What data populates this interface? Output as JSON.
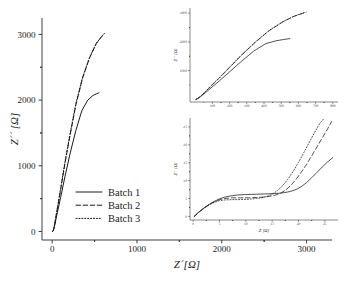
{
  "figure": {
    "background_color": "#ffffff",
    "line_color": "#1a1a1a"
  },
  "legend": {
    "entries": [
      {
        "label": "Batch 1",
        "style": "solid"
      },
      {
        "label": "Batch 2",
        "style": "dashed"
      },
      {
        "label": "Batch 3",
        "style": "dotted"
      }
    ]
  },
  "chart_data": [
    {
      "id": "main",
      "type": "line",
      "title": "",
      "xlabel": "Z´[Ω]",
      "ylabel": "Z´´ [Ω]",
      "xlim": [
        -120,
        3300
      ],
      "ylim": [
        -130,
        3250
      ],
      "xticks": [
        0,
        1000,
        2000,
        3000
      ],
      "yticks": [
        0,
        1000,
        2000,
        3000
      ],
      "xtick_labels": [
        "0",
        "1000",
        "2000",
        "3000"
      ],
      "ytick_labels": [
        "0",
        "1000",
        "2000",
        "3000"
      ],
      "minor_ticks": true,
      "grid": false,
      "legend_position": "center-left",
      "series": [
        {
          "name": "Batch 1",
          "style": "solid",
          "x": [
            5,
            12,
            20,
            30,
            45,
            70,
            100,
            150,
            210,
            280,
            350,
            420,
            480,
            520,
            550
          ],
          "y": [
            0,
            12,
            40,
            95,
            190,
            340,
            520,
            830,
            1180,
            1540,
            1840,
            2000,
            2070,
            2095,
            2110
          ]
        },
        {
          "name": "Batch 2",
          "style": "dashed",
          "x": [
            5,
            12,
            20,
            30,
            45,
            70,
            100,
            150,
            210,
            280,
            360,
            440,
            520,
            580,
            615
          ],
          "y": [
            0,
            14,
            48,
            115,
            230,
            410,
            640,
            1030,
            1460,
            1930,
            2340,
            2640,
            2860,
            2960,
            3010
          ]
        },
        {
          "name": "Batch 3",
          "style": "dotted",
          "x": [
            5,
            12,
            20,
            30,
            45,
            70,
            100,
            150,
            210,
            280,
            360,
            440,
            520,
            580,
            612
          ],
          "y": [
            0,
            14,
            50,
            120,
            238,
            420,
            655,
            1050,
            1480,
            1950,
            2355,
            2650,
            2865,
            2965,
            3012
          ]
        }
      ]
    },
    {
      "id": "inset_top",
      "type": "line",
      "title": "",
      "xlabel": "Z´[Ω]",
      "ylabel": "Z´´ [Ω]",
      "xlim": [
        -30,
        830
      ],
      "ylim": [
        -90,
        3180
      ],
      "xticks": [
        100,
        200,
        300,
        400,
        500,
        600,
        700,
        800
      ],
      "yticks": [
        1000,
        2000,
        3000
      ],
      "xtick_labels": [
        "100",
        "200",
        "300",
        "400",
        "500",
        "600",
        "700",
        "800"
      ],
      "ytick_labels": [
        "1000",
        "2000",
        "3000"
      ],
      "minor_ticks": true,
      "grid": false,
      "series": [
        {
          "name": "Batch 1",
          "style": "solid",
          "x": [
            5,
            15,
            30,
            55,
            90,
            140,
            200,
            270,
            340,
            410,
            470,
            515,
            550
          ],
          "y": [
            0,
            30,
            90,
            210,
            390,
            640,
            960,
            1330,
            1680,
            1940,
            2040,
            2085,
            2115
          ]
        },
        {
          "name": "Batch 2",
          "style": "dashed",
          "x": [
            5,
            15,
            30,
            55,
            90,
            140,
            200,
            270,
            350,
            430,
            510,
            570,
            620,
            645
          ],
          "y": [
            0,
            34,
            100,
            240,
            450,
            740,
            1110,
            1540,
            1990,
            2390,
            2700,
            2880,
            2985,
            3035
          ]
        },
        {
          "name": "Batch 3",
          "style": "dotted",
          "x": [
            5,
            15,
            30,
            55,
            90,
            140,
            200,
            270,
            350,
            430,
            510,
            570,
            618,
            642
          ],
          "y": [
            0,
            36,
            104,
            248,
            462,
            755,
            1125,
            1555,
            2000,
            2400,
            2705,
            2885,
            2988,
            3038
          ]
        }
      ]
    },
    {
      "id": "inset_bottom",
      "type": "line",
      "title": "",
      "xlabel": "Z´[Ω]",
      "ylabel": "Z´´ [Ω]",
      "xlim": [
        -0.6,
        27.5
      ],
      "ylim": [
        -1.0,
        27.5
      ],
      "xticks": [
        0,
        5,
        10,
        15,
        20,
        25
      ],
      "yticks": [
        0,
        5,
        10,
        15,
        20,
        25
      ],
      "xtick_labels": [
        "0",
        "5",
        "10",
        "15",
        "20",
        "25"
      ],
      "ytick_labels": [
        "0",
        "5",
        "10",
        "15",
        "20",
        "25"
      ],
      "minor_ticks": true,
      "grid": false,
      "series": [
        {
          "name": "Batch 1",
          "style": "solid",
          "x": [
            0.2,
            1.0,
            2.0,
            3.0,
            4.0,
            5.0,
            6.0,
            7.0,
            8.5,
            10.0,
            12.0,
            14.0,
            15.5,
            16.5,
            17.5,
            18.5,
            19.5,
            20.5,
            21.5,
            22.5,
            23.5,
            24.5,
            25.5,
            26.5
          ],
          "y": [
            0.0,
            1.1,
            2.3,
            3.3,
            4.2,
            4.9,
            5.4,
            5.7,
            6.0,
            6.1,
            6.2,
            6.3,
            6.4,
            6.5,
            6.7,
            7.0,
            7.5,
            8.3,
            9.4,
            10.8,
            12.3,
            13.8,
            15.2,
            16.4
          ]
        },
        {
          "name": "Batch 2",
          "style": "dashed",
          "x": [
            0.2,
            1.0,
            2.0,
            3.0,
            4.0,
            5.0,
            6.0,
            7.5,
            9.0,
            10.5,
            12.0,
            13.5,
            14.5,
            15.5,
            16.5,
            17.5,
            18.5,
            19.5,
            20.5,
            21.5,
            22.5,
            23.5,
            24.5,
            25.5,
            26.3
          ],
          "y": [
            0.0,
            1.1,
            2.3,
            3.3,
            4.1,
            4.7,
            5.0,
            5.2,
            5.2,
            5.2,
            5.3,
            5.4,
            5.6,
            5.9,
            6.4,
            7.3,
            8.6,
            10.3,
            12.3,
            14.5,
            16.9,
            19.4,
            21.9,
            24.4,
            26.5
          ]
        },
        {
          "name": "Batch 3",
          "style": "dotted",
          "x": [
            0.2,
            1.0,
            2.0,
            3.0,
            4.0,
            5.0,
            6.0,
            7.5,
            9.0,
            10.5,
            12.0,
            13.0,
            14.0,
            15.0,
            16.0,
            17.0,
            18.0,
            19.0,
            20.0,
            21.0,
            22.0,
            23.0,
            24.0,
            24.8
          ],
          "y": [
            0.0,
            1.1,
            2.2,
            3.2,
            3.9,
            4.4,
            4.6,
            4.7,
            4.7,
            4.8,
            5.0,
            5.2,
            5.6,
            6.2,
            7.2,
            8.6,
            10.4,
            12.6,
            15.1,
            17.8,
            20.6,
            23.3,
            25.9,
            27.3
          ]
        }
      ]
    }
  ]
}
